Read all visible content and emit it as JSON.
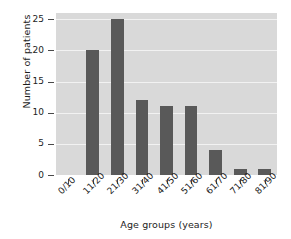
{
  "chart_data": {
    "type": "bar",
    "title": "",
    "xlabel": "Age groups (years)",
    "ylabel": "Number of patients",
    "categories": [
      "0/10",
      "11/20",
      "21/30",
      "31/40",
      "41/50",
      "51/60",
      "61/70",
      "71/80",
      "81/90"
    ],
    "values": [
      0,
      20,
      25,
      12,
      11,
      11,
      4,
      1,
      1
    ],
    "ylim": [
      0,
      26
    ],
    "yticks": [
      0,
      5,
      10,
      15,
      20,
      25
    ],
    "ytick_labels": [
      "0",
      "5",
      "10",
      "15",
      "20",
      "25"
    ],
    "grid": true,
    "grid_axis": "y",
    "legend": false,
    "legend_position": "none",
    "bar_color": "#595959",
    "plot_background": "#d9d9d9",
    "gridline_color": "#f2f2f2",
    "figure_background": "#ffffff",
    "xtick_label_rotation": -45
  }
}
